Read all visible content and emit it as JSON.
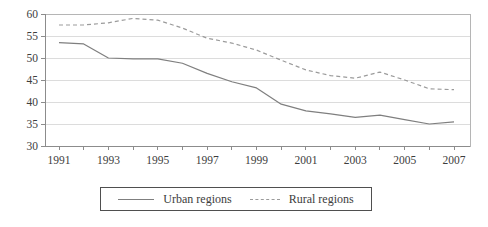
{
  "chart_data": {
    "type": "line",
    "x": [
      1991,
      1992,
      1993,
      1994,
      1995,
      1996,
      1997,
      1998,
      1999,
      2000,
      2001,
      2002,
      2003,
      2004,
      2005,
      2006,
      2007
    ],
    "x_tick_labels": [
      1991,
      1993,
      1995,
      1997,
      1999,
      2001,
      2003,
      2005,
      2007
    ],
    "y_ticks": [
      30,
      35,
      40,
      45,
      50,
      55,
      60
    ],
    "ylim": [
      30,
      60
    ],
    "grid": "horizontal",
    "legend_position": "bottom",
    "series": [
      {
        "name": "Urban regions",
        "style": "solid",
        "color": "#7f7f7f",
        "values": [
          53.5,
          53.2,
          50.0,
          49.8,
          49.8,
          48.8,
          46.5,
          44.6,
          43.2,
          39.5,
          38.0,
          37.3,
          36.5,
          37.0,
          36.0,
          35.0,
          35.5
        ]
      },
      {
        "name": "Rural regions",
        "style": "dashed",
        "color": "#9b9b9b",
        "values": [
          57.5,
          57.5,
          58.0,
          59.0,
          58.6,
          56.8,
          54.5,
          53.4,
          51.8,
          49.5,
          47.3,
          46.0,
          45.4,
          46.8,
          45.0,
          43.0,
          42.8
        ]
      }
    ]
  },
  "colors": {
    "grid": "#dcdcdc",
    "frame": "#b5b5b5",
    "spine": "#8c8c8c",
    "text": "#3d3d3d",
    "legend_border": "#4f4f4f"
  }
}
